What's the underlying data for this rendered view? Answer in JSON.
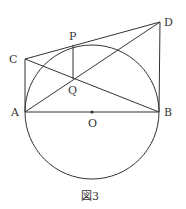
{
  "figure": {
    "caption": "図3",
    "colors": {
      "stroke": "#333333",
      "background": "#ffffff"
    },
    "circle": {
      "center": "O",
      "cx": 92,
      "cy": 112,
      "r": 67
    },
    "points": {
      "A": {
        "label": "A",
        "x": 25,
        "y": 112
      },
      "B": {
        "label": "B",
        "x": 159,
        "y": 112
      },
      "O": {
        "label": "O",
        "x": 92,
        "y": 112
      },
      "C": {
        "label": "C",
        "x": 25,
        "y": 59
      },
      "D": {
        "label": "D",
        "x": 160,
        "y": 22
      },
      "P": {
        "label": "P",
        "x": 73,
        "y": 45
      },
      "Q": {
        "label": "Q",
        "x": 73,
        "y": 79
      }
    },
    "segments": [
      "AB",
      "AC",
      "BD",
      "CD",
      "AD",
      "CB",
      "PQ"
    ]
  }
}
